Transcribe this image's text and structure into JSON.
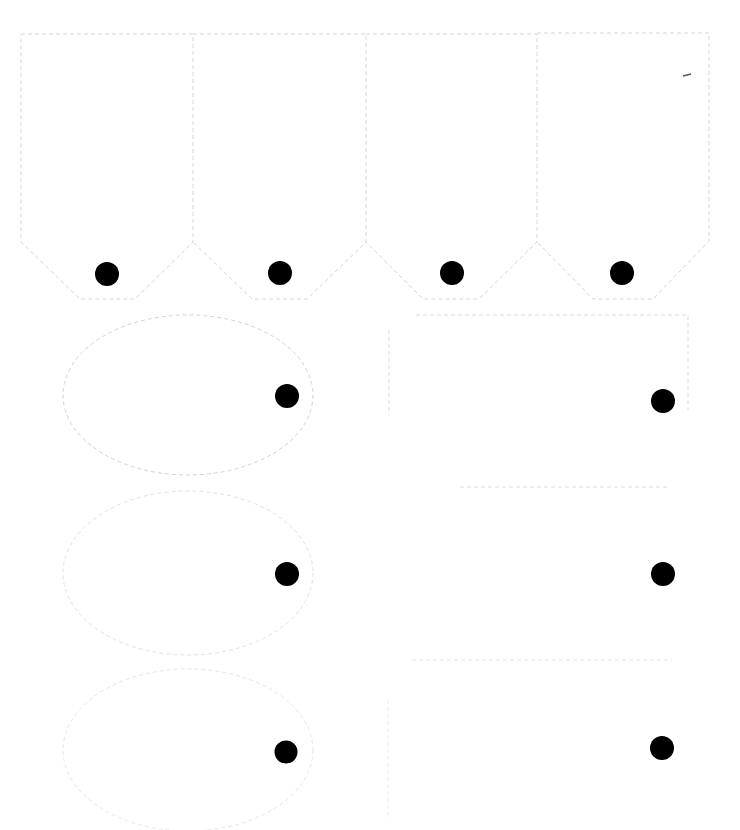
{
  "sheet": {
    "kind": "printable-tag-template",
    "background": "#ffffff",
    "cut_line_color": "#d6d6d6",
    "faint_cut_line_color": "#ebebeb",
    "hole_color": "#000000"
  },
  "banner_tags": [
    {
      "label": "",
      "hole_x": 107,
      "hole_y": 274
    },
    {
      "label": "",
      "hole_x": 280,
      "hole_y": 273
    },
    {
      "label": "",
      "hole_x": 452,
      "hole_y": 273
    },
    {
      "label": "",
      "hole_x": 622,
      "hole_y": 273
    }
  ],
  "oval_tags": [
    {
      "label": "",
      "cx": 188,
      "cy": 395,
      "hole_x": 287,
      "hole_y": 396
    },
    {
      "label": "",
      "cx": 188,
      "cy": 573,
      "hole_x": 287,
      "hole_y": 574
    },
    {
      "label": "",
      "cx": 188,
      "cy": 748,
      "hole_x": 286,
      "hole_y": 752
    }
  ],
  "rect_tags": [
    {
      "label": "",
      "hole_x": 663,
      "hole_y": 401
    },
    {
      "label": "",
      "hole_x": 663,
      "hole_y": 574
    },
    {
      "label": "",
      "hole_x": 662,
      "hole_y": 748
    }
  ]
}
